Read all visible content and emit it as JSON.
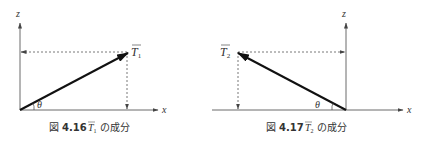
{
  "figures": [
    {
      "id": "fig-4-16",
      "axes": {
        "x_label": "x",
        "z_label": "z"
      },
      "vector": {
        "name": "T",
        "subscript": "1",
        "direction": "up-right"
      },
      "angle_label": "θ",
      "caption": {
        "prefix": "図",
        "number": "4.16",
        "vector_name": "T",
        "vector_subscript": "1",
        "suffix": "の成分"
      }
    },
    {
      "id": "fig-4-17",
      "axes": {
        "x_label": "x",
        "z_label": "z"
      },
      "vector": {
        "name": "T",
        "subscript": "2",
        "direction": "up-left"
      },
      "angle_label": "θ",
      "caption": {
        "prefix": "図",
        "number": "4.17",
        "vector_name": "T",
        "vector_subscript": "2",
        "suffix": "の成分"
      }
    }
  ],
  "colors": {
    "line": "#222222",
    "dashed": "#555555",
    "text": "#333333"
  }
}
